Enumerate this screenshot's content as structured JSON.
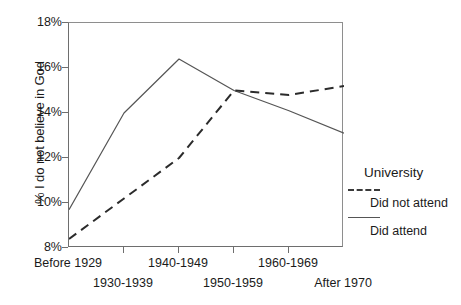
{
  "chart_data": {
    "type": "line",
    "title": "",
    "xlabel": "",
    "ylabel": "% I do not believe in God",
    "categories": [
      "Before 1929",
      "1930-1939",
      "1940-1949",
      "1950-1959",
      "1960-1969",
      "After 1970"
    ],
    "ylim": [
      8,
      18
    ],
    "yticks": [
      8,
      10,
      12,
      14,
      16,
      18
    ],
    "ytick_labels": [
      "8%",
      "10%",
      "12%",
      "14%",
      "16%",
      "18%"
    ],
    "grid": false,
    "legend_position": "right",
    "legend_title": "University",
    "series": [
      {
        "name": "Did not attend",
        "style": "dashed",
        "color": "#2b2b2b",
        "values": [
          8.4,
          10.2,
          12.0,
          15.0,
          14.8,
          15.2
        ]
      },
      {
        "name": "Did attend",
        "style": "solid",
        "color": "#555555",
        "values": [
          9.7,
          14.0,
          16.4,
          15.0,
          14.1,
          13.1
        ]
      }
    ]
  },
  "legend": {
    "title": "University",
    "entries": [
      {
        "label": "Did not attend",
        "style": "dashed"
      },
      {
        "label": "Did attend",
        "style": "solid"
      }
    ]
  }
}
